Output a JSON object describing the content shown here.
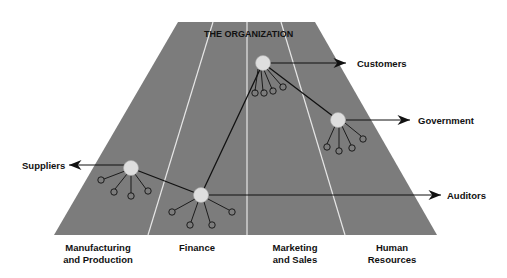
{
  "diagram": {
    "title": "THE ORGANIZATION",
    "colors": {
      "trapezoid": "#7c7c7c",
      "divider": "#e6e6e6",
      "node_fill": "#dedede",
      "line": "#111111",
      "text": "#111111"
    },
    "departments": [
      {
        "label": "Manufacturing\nand Production"
      },
      {
        "label": "Finance"
      },
      {
        "label": "Marketing\nand Sales"
      },
      {
        "label": "Human\nResources"
      }
    ],
    "external_entities": [
      {
        "label": "Suppliers",
        "direction": "left"
      },
      {
        "label": "Customers",
        "direction": "right"
      },
      {
        "label": "Government",
        "direction": "right"
      },
      {
        "label": "Auditors",
        "direction": "right"
      }
    ]
  }
}
